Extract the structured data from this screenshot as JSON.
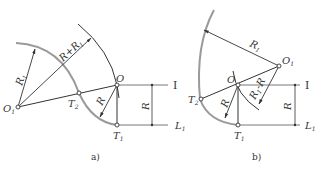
{
  "figure": {
    "panels": [
      {
        "id": "a",
        "caption": "a)",
        "labels": {
          "O1": "O",
          "O1_sub": "1",
          "O": "O",
          "T1": "T",
          "T1_sub": "1",
          "T2": "T",
          "T2_sub": "2",
          "R1": "R",
          "R1_sub": "1",
          "R_plus_R1": "R+R",
          "R_plus_R1_sub": "1",
          "R": "R",
          "R_dim": "R",
          "line_I": "I",
          "L1": "L",
          "L1_sub": "1"
        }
      },
      {
        "id": "b",
        "caption": "b)",
        "labels": {
          "O1": "O",
          "O1_sub": "1",
          "O": "O",
          "T1": "T",
          "T1_sub": "1",
          "T2": "T",
          "T2_sub": "2",
          "R1": "R",
          "R1_sub": "1",
          "R1_minus_R": "R",
          "R1_minus_R_sub": "1",
          "R1_minus_R_tail": "-R",
          "R": "R",
          "R_dim": "R",
          "line_I": "I",
          "L1": "L",
          "L1_sub": "1"
        }
      }
    ],
    "colors": {
      "line": "#333333",
      "arc_gray": "#9a9a9a"
    }
  }
}
